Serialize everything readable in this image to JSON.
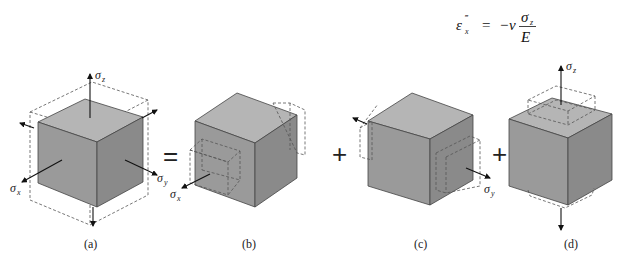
{
  "equation": {
    "lhs_symbol": "ε",
    "lhs_sub": "x",
    "lhs_sup": "‴",
    "equals": "=",
    "rhs_prefix": "−ν",
    "numerator": "σ",
    "numerator_sub": "z",
    "denominator": "E"
  },
  "operators": {
    "equals": "=",
    "plus1": "+",
    "plus2": "+"
  },
  "panels": [
    {
      "id": "a",
      "caption": "(a)",
      "labels": {
        "sz": "σ",
        "sz_sub": "z",
        "sx": "σ",
        "sx_sub": "x",
        "sy": "σ",
        "sy_sub": "y"
      }
    },
    {
      "id": "b",
      "caption": "(b)",
      "labels": {
        "sx": "σ",
        "sx_sub": "x"
      }
    },
    {
      "id": "c",
      "caption": "(c)",
      "labels": {
        "sy": "σ",
        "sy_sub": "y"
      }
    },
    {
      "id": "d",
      "caption": "(d)",
      "labels": {
        "sz": "σ",
        "sz_sub": "z"
      }
    }
  ],
  "colors": {
    "cube_front": "#9a9a9a",
    "cube_top": "#b5b5b5",
    "cube_right": "#8a8a8a",
    "line": "#444444"
  }
}
